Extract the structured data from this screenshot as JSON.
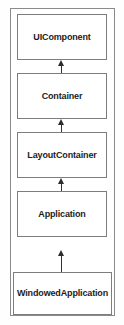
{
  "diagram": {
    "type": "class-inheritance-hierarchy",
    "title": "",
    "border_color": "#8a8a8a",
    "node_border_color": "#7d7d7d",
    "node_fill": "#ffffff",
    "text_color": "#1c1c1c",
    "arrow_color": "#2b2b2b",
    "nodes": [
      {
        "label": "UIComponent"
      },
      {
        "label": "Container"
      },
      {
        "label": "LayoutContainer"
      },
      {
        "label": "Application"
      },
      {
        "label": "WindowedApplication"
      }
    ],
    "edges": [
      {
        "from": "Container",
        "to": "UIComponent",
        "kind": "generalization"
      },
      {
        "from": "LayoutContainer",
        "to": "Container",
        "kind": "generalization"
      },
      {
        "from": "Application",
        "to": "LayoutContainer",
        "kind": "generalization"
      },
      {
        "from": "WindowedApplication",
        "to": "Application",
        "kind": "generalization"
      }
    ]
  }
}
